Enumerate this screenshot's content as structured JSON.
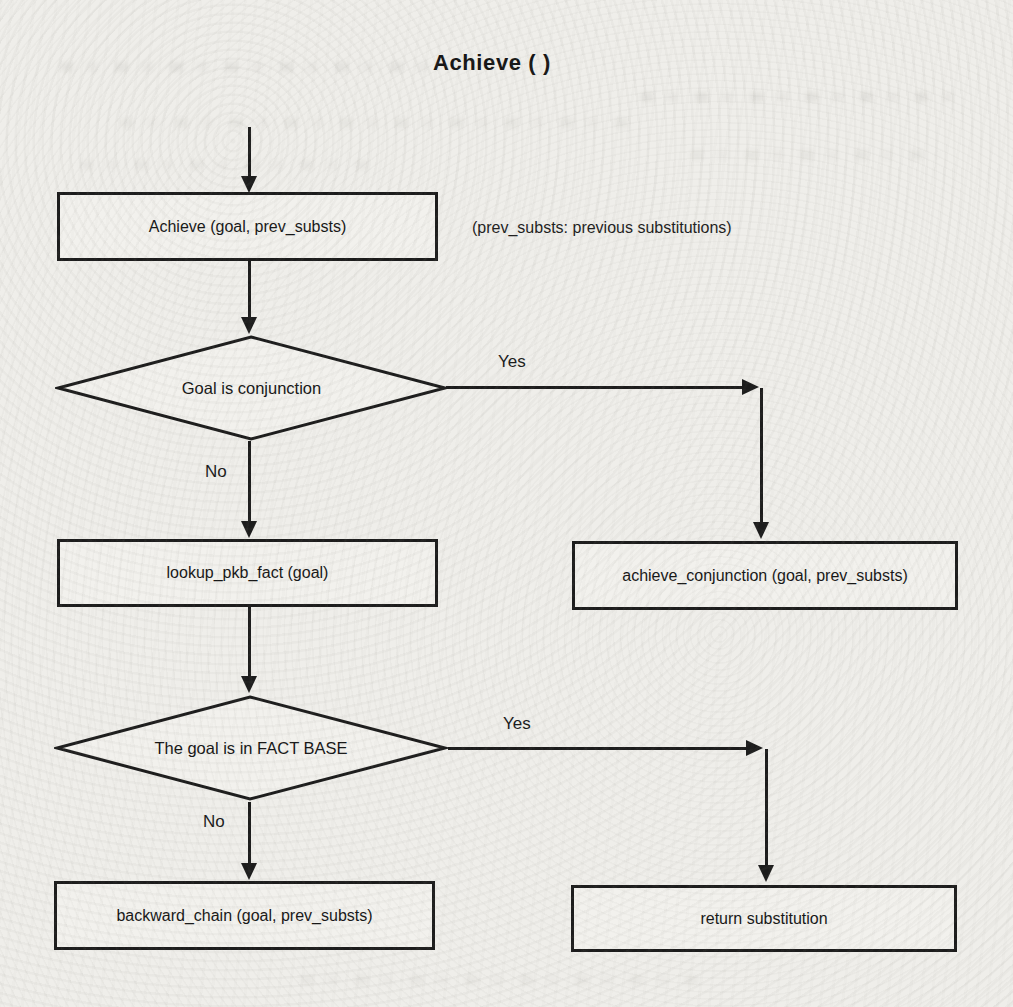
{
  "title": "Achieve ( )",
  "annotation": "(prev_substs: previous substitutions)",
  "nodes": {
    "achieve": {
      "label": "Achieve (goal, prev_substs)"
    },
    "goal_is_conjunction": {
      "label": "Goal is conjunction"
    },
    "lookup_pkb_fact": {
      "label": "lookup_pkb_fact (goal)"
    },
    "achieve_conjunction": {
      "label": "achieve_conjunction (goal, prev_substs)"
    },
    "goal_in_fact_base": {
      "label": "The goal is in FACT BASE"
    },
    "backward_chain": {
      "label": "backward_chain (goal, prev_substs)"
    },
    "return_substitution": {
      "label": "return substitution"
    }
  },
  "edges": {
    "conjunction_yes": "Yes",
    "conjunction_no": "No",
    "factbase_yes": "Yes",
    "factbase_no": "No"
  },
  "colors": {
    "ink": "#1c1c1c",
    "paper": "#efeeea"
  }
}
